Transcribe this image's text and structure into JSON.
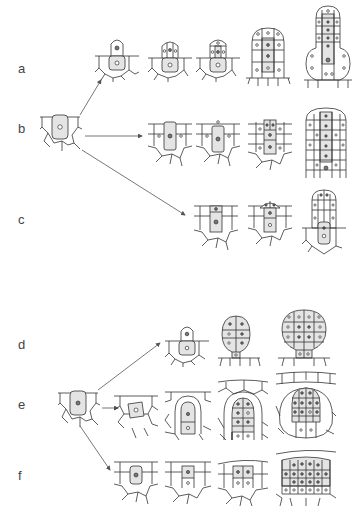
{
  "figure": {
    "groups": [
      {
        "id": "upper",
        "origin_label": "initial cell (shaded)",
        "rows": [
          {
            "label": "a",
            "stages": 5,
            "form": "emergent multicellular hair/gland"
          },
          {
            "label": "b",
            "stages": 4,
            "form": "embedded column of cells"
          },
          {
            "label": "c",
            "stages": 3,
            "form": "partly emergent structure"
          }
        ]
      },
      {
        "id": "lower",
        "origin_label": "initial cell (shaded)",
        "rows": [
          {
            "label": "d",
            "stages": 3,
            "form": "emergent stalked club"
          },
          {
            "label": "e",
            "stages": 4,
            "form": "sunken structure within cavity"
          },
          {
            "label": "f",
            "stages": 3,
            "form": "embedded cell cluster"
          }
        ]
      }
    ]
  },
  "labels": {
    "a": "a",
    "b": "b",
    "c": "c",
    "d": "d",
    "e": "e",
    "f": "f"
  }
}
